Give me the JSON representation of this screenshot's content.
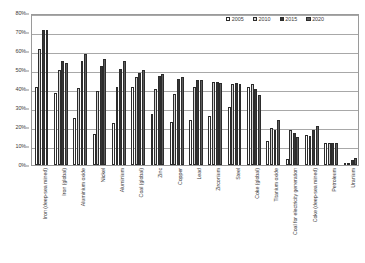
{
  "chart_data": {
    "type": "bar",
    "title": "",
    "subtitle": "",
    "xlabel": "",
    "ylabel": "",
    "ylim": [
      0,
      80
    ],
    "ytick_labels": [
      "0%",
      "10%",
      "20%",
      "30%",
      "40%",
      "50%",
      "60%",
      "70%",
      "80%"
    ],
    "ytick_values": [
      0,
      10,
      20,
      30,
      40,
      50,
      60,
      70,
      80
    ],
    "grid": true,
    "legend_position": "top-right",
    "value_unit": "%",
    "categories": [
      "Iron (deep-sea mined)",
      "Iron (global)",
      "Aluminium oxide",
      "Nickel",
      "Aluminium",
      "Coal (global)",
      "Zinc",
      "Copper",
      "Lead",
      "Zirconium",
      "Steel",
      "Coke (global)",
      "Titanium oxide",
      "Coal for electricity generation",
      "Coke (deep-sea mined)",
      "Petroleum",
      "Uranium"
    ],
    "series": [
      {
        "name": "2005",
        "color": "#ffffff",
        "values": [
          41,
          38,
          24.5,
          16.5,
          22,
          41,
          27,
          22.5,
          23.5,
          26,
          30.5,
          41,
          12.5,
          3,
          16,
          11.5,
          0.3
        ]
      },
      {
        "name": "2010",
        "color": "#d2d2d2",
        "values": [
          61,
          50,
          40.5,
          39,
          41,
          46.5,
          40,
          37.5,
          41,
          43.5,
          42.5,
          42.5,
          19.5,
          18.5,
          15.5,
          11.5,
          0.8
        ]
      },
      {
        "name": "2015",
        "color": "#353535",
        "values": [
          71,
          55,
          54.5,
          52,
          50.5,
          48.5,
          47,
          45.5,
          44.5,
          43.5,
          43,
          40,
          18.5,
          17,
          18.5,
          11.5,
          2.5
        ]
      },
      {
        "name": "2020",
        "color": "#5e5e5e",
        "values": [
          71,
          53.5,
          58.5,
          56,
          54.5,
          50,
          48,
          46.5,
          44.5,
          43,
          42.5,
          37,
          23.5,
          14.5,
          20.5,
          11.5,
          3.8
        ]
      }
    ]
  },
  "legend": {
    "items": [
      {
        "label": "2005"
      },
      {
        "label": "2010"
      },
      {
        "label": "2015"
      },
      {
        "label": "2020"
      }
    ]
  }
}
